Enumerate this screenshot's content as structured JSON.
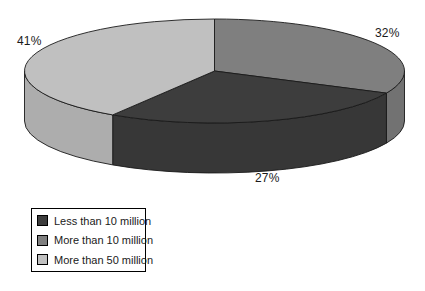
{
  "background_color": "#ffffff",
  "chart_data": {
    "type": "pie",
    "style": "3d",
    "title": "",
    "series": [
      {
        "label": "Less than 10 million",
        "value": 27,
        "percent_label": "27%",
        "color": "#3d3d3d"
      },
      {
        "label": "More than 10 million",
        "value": 32,
        "percent_label": "32%",
        "color": "#7f7f7f"
      },
      {
        "label": "More than 50 million",
        "value": 41,
        "percent_label": "41%",
        "color": "#c0c0c0"
      }
    ],
    "start": "12-oclock",
    "direction": "clockwise",
    "draw_order": [
      1,
      0,
      2
    ],
    "legend_position": "bottom-left",
    "outline_color": "#1a1a1a"
  }
}
